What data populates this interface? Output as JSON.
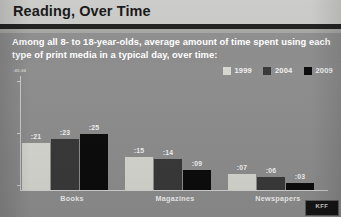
{
  "header": {
    "title": "Reading, Over Time"
  },
  "subtitle": {
    "text": "Among all 8- to 18-year-olds, average amount of time spent using each type of print media in a typical day, over time:"
  },
  "legend": {
    "items": [
      {
        "label": "1999",
        "color": "#d8d8d2"
      },
      {
        "label": "2004",
        "color": "#3a3a3a"
      },
      {
        "label": "2009",
        "color": "#0d0d0d"
      }
    ]
  },
  "axis": {
    "y_label": ":45:00"
  },
  "logo": {
    "text": "KFF"
  },
  "chart_data": {
    "type": "bar",
    "title": "Reading, Over Time",
    "subtitle": "Among all 8- to 18-year-olds, average amount of time spent using each type of print media in a typical day, over time:",
    "xlabel": "",
    "ylabel": "",
    "grid": false,
    "legend_position": "top-right",
    "categories": [
      "Books",
      "Magazines",
      "Newspapers"
    ],
    "series": [
      {
        "name": "1999",
        "color": "#d8d8d2",
        "values": [
          21,
          15,
          7
        ],
        "labels": [
          ":21",
          ":15",
          ":07"
        ]
      },
      {
        "name": "2004",
        "color": "#3a3a3a",
        "values": [
          23,
          14,
          6
        ],
        "labels": [
          ":23",
          ":14",
          ":06"
        ]
      },
      {
        "name": "2009",
        "color": "#0d0d0d",
        "values": [
          25,
          9,
          3
        ],
        "labels": [
          ":25",
          ":09",
          ":03"
        ]
      }
    ],
    "ylim": [
      0,
      45
    ],
    "units": "minutes per day"
  }
}
